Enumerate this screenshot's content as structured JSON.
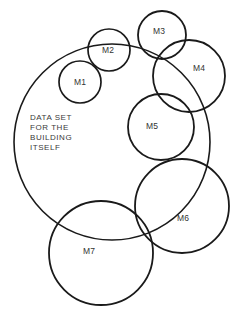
{
  "diagram": {
    "title": "Data set for the building itself",
    "caption": {
      "lines": [
        "DATA SET",
        "FOR THE",
        "BUILDING",
        "ITSELF"
      ],
      "line1": "DATA SET",
      "line2": "FOR THE",
      "line3": "BUILDING",
      "line4": "ITSELF",
      "x": 30,
      "y": 120
    },
    "style": {
      "stroke_color": "#1a1a1a",
      "fill_color": "none",
      "background_color": "#ffffff",
      "text_color": "#333333",
      "main_stroke_width": 1.6,
      "sub_stroke_width": 1.8
    },
    "main_set": {
      "name": "building-itself",
      "cx": 112,
      "cy": 142,
      "r": 98,
      "stroke_width": 1.6
    },
    "sub_sets": [
      {
        "label": "M1",
        "cx": 80,
        "cy": 82,
        "r": 21,
        "stroke_width": 1.7,
        "label_x": 80,
        "label_y": 85
      },
      {
        "label": "M2",
        "cx": 109,
        "cy": 50,
        "r": 21,
        "stroke_width": 1.7,
        "label_x": 108,
        "label_y": 53
      },
      {
        "label": "M3",
        "cx": 162,
        "cy": 35,
        "r": 24,
        "stroke_width": 1.8,
        "label_x": 159,
        "label_y": 34
      },
      {
        "label": "M4",
        "cx": 189,
        "cy": 76,
        "r": 36,
        "stroke_width": 1.8,
        "label_x": 199,
        "label_y": 71
      },
      {
        "label": "M5",
        "cx": 161,
        "cy": 127,
        "r": 33,
        "stroke_width": 1.8,
        "label_x": 152,
        "label_y": 129
      },
      {
        "label": "M6",
        "cx": 182,
        "cy": 206,
        "r": 47,
        "stroke_width": 1.8,
        "label_x": 183,
        "label_y": 221
      },
      {
        "label": "M7",
        "cx": 101,
        "cy": 253,
        "r": 52,
        "stroke_width": 1.8,
        "label_x": 89,
        "label_y": 254
      }
    ]
  }
}
